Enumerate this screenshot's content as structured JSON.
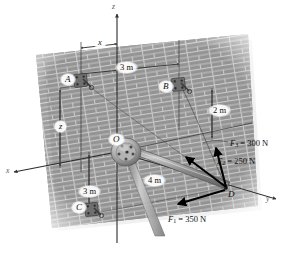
{
  "figure": {
    "type": "statics-free-body-diagram",
    "background_color": "#ffffff",
    "wall_color": "#9a9a9a",
    "mortar_color": "#d8d8d8",
    "line_color": "#1a1a1a",
    "axes": {
      "z_label": "z",
      "x_label": "x",
      "y_label": "y"
    },
    "points": [
      {
        "id": "A",
        "label": "A",
        "role": "wall-anchor-bracket"
      },
      {
        "id": "B",
        "label": "B",
        "role": "wall-anchor-bracket"
      },
      {
        "id": "C",
        "label": "C",
        "role": "wall-anchor-bracket"
      },
      {
        "id": "D",
        "label": "D",
        "role": "boom-tip-force-application"
      },
      {
        "id": "O",
        "label": "O",
        "role": "boom-base-hub-origin"
      }
    ],
    "dimensions": [
      {
        "id": "x-dim",
        "label": "x",
        "orientation": "horizontal",
        "note": "from z-axis to A column"
      },
      {
        "id": "z-dim",
        "label": "z",
        "orientation": "vertical",
        "note": "from x-axis up to A level"
      },
      {
        "id": "ab-dim",
        "label": "3 m",
        "orientation": "horizontal",
        "note": "A column to B column"
      },
      {
        "id": "b2-dim",
        "label": "2 m",
        "orientation": "vertical",
        "note": "B down to x-axis level"
      },
      {
        "id": "oc-dim",
        "label": "3 m",
        "orientation": "vertical",
        "note": "x-axis down to C level"
      },
      {
        "id": "od-dim",
        "label": "4 m",
        "orientation": "along-boom",
        "note": "boom length O to D"
      }
    ],
    "forces": [
      {
        "id": "F1",
        "name": "F",
        "subscript": "1",
        "value": 350,
        "unit": "N",
        "label": "F₁ = 350 N",
        "label_main": "F",
        "label_sub": "1",
        "label_tail": " = 350 N",
        "direction": "down-left from D toward C",
        "applied_at": "D"
      },
      {
        "id": "F2",
        "name": "F",
        "subscript": "2",
        "value": 250,
        "unit": "N",
        "label": "F₂ = 250 N",
        "label_main": "F",
        "label_sub": "2",
        "label_tail": " = 250 N",
        "direction": "up-left from D toward A",
        "applied_at": "D"
      },
      {
        "id": "F3",
        "name": "F",
        "subscript": "3",
        "value": 300,
        "unit": "N",
        "label": "F₃ = 300 N",
        "label_main": "F",
        "label_sub": "3",
        "label_tail": " = 300 N",
        "direction": "up from D toward B",
        "applied_at": "D"
      }
    ],
    "labels": {
      "x_dim": "x",
      "z_dim": "z",
      "three_m_top": "3 m",
      "two_m_right": "2 m",
      "three_m_bottom": "3 m",
      "four_m_boom": "4 m",
      "point_A": "A",
      "point_B": "B",
      "point_C": "C",
      "point_D": "D",
      "point_O": "O",
      "axis_z": "z",
      "axis_x": "x",
      "axis_y": "y"
    }
  }
}
